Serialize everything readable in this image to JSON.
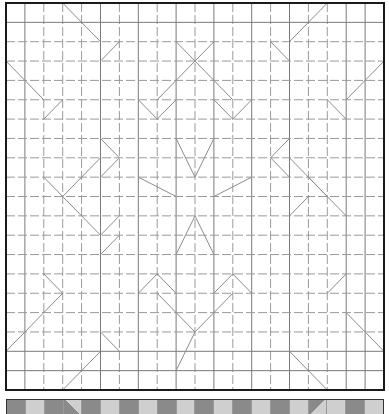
{
  "diagram": {
    "type": "origami-crease-pattern",
    "grid": {
      "cols": 20,
      "rows": 20
    },
    "colors": {
      "border": "#1a1a1a",
      "mountain": "#7a7a7a",
      "valley": "#9a9a9a",
      "diagonal": "#8c8c8c",
      "strip_dark": "#8a8a8a",
      "strip_light": "#cfcfcf"
    },
    "valley_rows": [
      2,
      3,
      4,
      5,
      6,
      7,
      8,
      9,
      10,
      11,
      12,
      13,
      14,
      15,
      16,
      17
    ],
    "valley_cols": [
      2,
      3,
      4,
      6,
      8,
      10,
      12,
      14,
      16,
      17
    ],
    "diagonals": [
      [
        3,
        0,
        5,
        2
      ],
      [
        5,
        3,
        6,
        2
      ],
      [
        0,
        3,
        2,
        5
      ],
      [
        2,
        6,
        3,
        5
      ],
      [
        9,
        2,
        10,
        3
      ],
      [
        10,
        3,
        11,
        2
      ],
      [
        10,
        3,
        8,
        5
      ],
      [
        7,
        5,
        8,
        6
      ],
      [
        8,
        6,
        9,
        5
      ],
      [
        10,
        3,
        12,
        5
      ],
      [
        11,
        5,
        12,
        6
      ],
      [
        12,
        6,
        13,
        5
      ],
      [
        14,
        2,
        15,
        3
      ],
      [
        15,
        2,
        17,
        0
      ],
      [
        17,
        5,
        18,
        6
      ],
      [
        18,
        5,
        20,
        3
      ],
      [
        9,
        7,
        10,
        9
      ],
      [
        10,
        9,
        11,
        7
      ],
      [
        7,
        9,
        9,
        10
      ],
      [
        13,
        9,
        11,
        10
      ],
      [
        9,
        13,
        10,
        11
      ],
      [
        10,
        11,
        11,
        13
      ],
      [
        5,
        7,
        6,
        8
      ],
      [
        6,
        8,
        5,
        9
      ],
      [
        5,
        8,
        3,
        10
      ],
      [
        2,
        9,
        3,
        10
      ],
      [
        3,
        10,
        5,
        12
      ],
      [
        5,
        12,
        6,
        11
      ],
      [
        5,
        13,
        6,
        12
      ],
      [
        14,
        8,
        15,
        7
      ],
      [
        14,
        8,
        15,
        9
      ],
      [
        15,
        8,
        17,
        10
      ],
      [
        16,
        9,
        17,
        10
      ],
      [
        17,
        10,
        18,
        11
      ],
      [
        15,
        11,
        16,
        10
      ],
      [
        2,
        14,
        3,
        15
      ],
      [
        3,
        15,
        0,
        18
      ],
      [
        5,
        17,
        6,
        18
      ],
      [
        7,
        15,
        8,
        14
      ],
      [
        8,
        14,
        9,
        15
      ],
      [
        8,
        15,
        10,
        17
      ],
      [
        10,
        17,
        12,
        15
      ],
      [
        11,
        15,
        12,
        14
      ],
      [
        12,
        14,
        13,
        15
      ],
      [
        9,
        19,
        10,
        17
      ],
      [
        17,
        15,
        18,
        14
      ],
      [
        18,
        16,
        20,
        18
      ],
      [
        15,
        18,
        17,
        20
      ],
      [
        3,
        20,
        5,
        18
      ]
    ],
    "strip": {
      "cells": [
        "dark",
        "light",
        "dark",
        "light-tri",
        "dark",
        "light",
        "dark",
        "light",
        "dark",
        "light",
        "dark",
        "light",
        "dark",
        "light",
        "dark",
        "light",
        "dark-tri",
        "light",
        "dark",
        "light"
      ]
    }
  }
}
